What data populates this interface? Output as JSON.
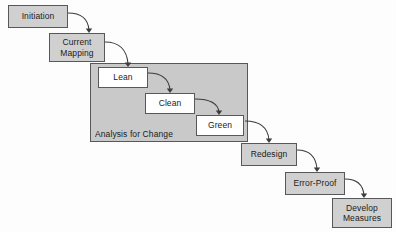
{
  "diagram": {
    "type": "flowchart",
    "colors": {
      "node_fill_gray": "#d0d0d0",
      "node_fill_white": "#ffffff",
      "panel_fill": "#c9c9c9",
      "border": "#58585a",
      "arrow": "#3c3c3e",
      "background": "#fdfdfd"
    },
    "group_panel": {
      "label": "Analysis for Change",
      "x": 90,
      "y": 63,
      "width": 158,
      "height": 79,
      "label_x": 95,
      "label_y": 129
    },
    "nodes": [
      {
        "id": "initiation",
        "label": "Initiation",
        "x": 8,
        "y": 5,
        "width": 60,
        "height": 23,
        "fill": "gray"
      },
      {
        "id": "current-mapping",
        "label": "Current\nMapping",
        "x": 49,
        "y": 33,
        "width": 56,
        "height": 29,
        "fill": "gray"
      },
      {
        "id": "lean",
        "label": "Lean",
        "x": 98,
        "y": 67,
        "width": 50,
        "height": 21,
        "fill": "white"
      },
      {
        "id": "clean",
        "label": "Clean",
        "x": 145,
        "y": 93,
        "width": 50,
        "height": 21,
        "fill": "white"
      },
      {
        "id": "green",
        "label": "Green",
        "x": 196,
        "y": 115,
        "width": 48,
        "height": 21,
        "fill": "white"
      },
      {
        "id": "redesign",
        "label": "Redesign",
        "x": 241,
        "y": 143,
        "width": 56,
        "height": 23,
        "fill": "gray"
      },
      {
        "id": "error-proof",
        "label": "Error-Proof",
        "x": 285,
        "y": 172,
        "width": 60,
        "height": 23,
        "fill": "gray"
      },
      {
        "id": "develop-measures",
        "label": "Develop\nMeasures",
        "x": 332,
        "y": 198,
        "width": 60,
        "height": 30,
        "fill": "gray"
      }
    ],
    "connections": [
      {
        "from": "initiation",
        "to": "current-mapping",
        "path": "M 68 13 C 80 13 88 18 89 30",
        "arrow_x": 89,
        "arrow_y": 33
      },
      {
        "from": "current-mapping",
        "to": "lean",
        "path": "M 105 42 C 119 42 127 50 128 64",
        "arrow_x": 128,
        "arrow_y": 67
      },
      {
        "from": "lean",
        "to": "clean",
        "path": "M 148 73 C 162 73 169 79 170 90",
        "arrow_x": 170,
        "arrow_y": 93
      },
      {
        "from": "clean",
        "to": "green",
        "path": "M 195 99 C 210 99 218 104 219 112",
        "arrow_x": 219,
        "arrow_y": 115
      },
      {
        "from": "green",
        "to": "redesign",
        "path": "M 245 121 C 260 121 268 128 269 140",
        "arrow_x": 269,
        "arrow_y": 143
      },
      {
        "from": "redesign",
        "to": "error-proof",
        "path": "M 297 150 C 310 150 316 157 317 169",
        "arrow_x": 317,
        "arrow_y": 172
      },
      {
        "from": "error-proof",
        "to": "develop-measures",
        "path": "M 345 179 C 357 179 363 185 364 195",
        "arrow_x": 364,
        "arrow_y": 198
      }
    ]
  }
}
